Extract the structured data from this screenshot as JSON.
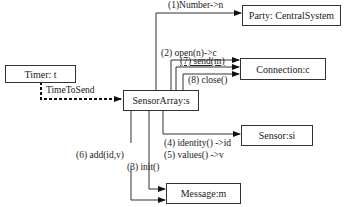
{
  "objects": {
    "timer": "Timer: t",
    "sensor_array": "SensorArray:s",
    "party": "Party: CentralSystem",
    "connection": "Connection:c",
    "sensor": "Sensor:si",
    "message": "Message:m"
  },
  "messages": {
    "time_to_send": "TimeToSend",
    "m1": "(1)Number->n",
    "m2": "(2) open(n)->c",
    "m7": "(7) send(m)",
    "m8": "(8) close()",
    "m4": "(4) identity() ->id",
    "m5": "(5) values() ->v",
    "m3": "(3) init()",
    "m6": "(6) add(id,v)"
  }
}
